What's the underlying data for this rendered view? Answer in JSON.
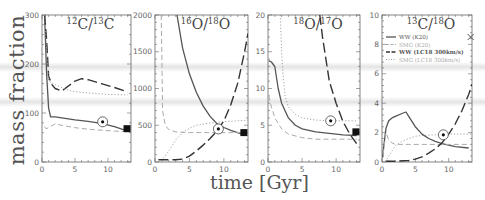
{
  "figure": {
    "ylabel": "mass fraction",
    "xlabel": "time [Gyr]"
  },
  "legend": {
    "entries": [
      {
        "label": "WW (K20)",
        "style": "solid",
        "color": "#555555"
      },
      {
        "label": "SMG (K20)",
        "style": "dashed",
        "color": "#aaaaaa"
      },
      {
        "label": "WW (LC18 300km/s)",
        "style": "long-dash",
        "color": "#333333"
      },
      {
        "label": "SMG (LC18 300km/s)",
        "style": "dotted",
        "color": "#999999"
      }
    ]
  },
  "chart_data": [
    {
      "type": "line",
      "title": "12C/13C",
      "title_parts": {
        "sup1": "12",
        "el1": "C",
        "sup2": "13",
        "el2": "C"
      },
      "xlabel": "time [Gyr]",
      "ylabel": "mass fraction",
      "xlim": [
        0,
        13.5
      ],
      "ylim": [
        0,
        300
      ],
      "xticks": [
        0,
        5,
        10
      ],
      "yticks": [
        0,
        100,
        200,
        300
      ],
      "series": [
        {
          "name": "WW (K20)",
          "x": [
            0.4,
            0.7,
            1.0,
            1.3,
            2,
            3,
            5,
            7,
            9,
            11,
            13
          ],
          "values": [
            300,
            180,
            110,
            92,
            92,
            90,
            86,
            83,
            79,
            72,
            63
          ]
        },
        {
          "name": "SMG (K20)",
          "x": [
            0.4,
            0.6,
            1,
            2,
            3,
            5,
            7,
            9,
            11,
            13
          ],
          "values": [
            72,
            68,
            70,
            78,
            75,
            70,
            67,
            65,
            63,
            62
          ]
        },
        {
          "name": "WW (LC18 300km/s)",
          "x": [
            0.4,
            0.7,
            1.0,
            1.5,
            2,
            3,
            4,
            5,
            6,
            7,
            9,
            11,
            13
          ],
          "values": [
            300,
            250,
            175,
            158,
            150,
            145,
            155,
            165,
            170,
            168,
            160,
            152,
            143
          ]
        },
        {
          "name": "SMG (LC18 300km/s)",
          "x": [
            0.4,
            0.7,
            1,
            2,
            4,
            6,
            8,
            10,
            13
          ],
          "values": [
            300,
            230,
            165,
            158,
            146,
            142,
            140,
            138,
            137
          ]
        }
      ],
      "markers": [
        {
          "type": "sun-circle",
          "x": 9.2,
          "y": 82
        },
        {
          "type": "filled-square",
          "x": 12.9,
          "y": 68
        }
      ]
    },
    {
      "type": "line",
      "title": "16O/18O",
      "title_parts": {
        "sup1": "16",
        "el1": "O",
        "sup2": "18",
        "el2": "O"
      },
      "xlabel": "time [Gyr]",
      "ylabel": "mass fraction",
      "xlim": [
        0,
        13.5
      ],
      "ylim": [
        0,
        2000
      ],
      "xticks": [
        0,
        5,
        10
      ],
      "yticks": [
        0,
        500,
        1000,
        1500,
        2000
      ],
      "series": [
        {
          "name": "WW (K20)",
          "x": [
            3.2,
            4,
            5,
            6,
            7,
            8,
            9,
            10,
            11,
            12,
            13
          ],
          "values": [
            2000,
            1550,
            1200,
            950,
            760,
            620,
            520,
            470,
            430,
            400,
            370
          ]
        },
        {
          "name": "SMG (K20)",
          "x": [
            0.9,
            1.0,
            1.1,
            1.5,
            2,
            3,
            5,
            7,
            9,
            11,
            13
          ],
          "values": [
            2000,
            1400,
            700,
            500,
            440,
            410,
            400,
            400,
            400,
            400,
            400
          ]
        },
        {
          "name": "WW (LC18 300km/s)",
          "x": [
            0.5,
            1,
            2,
            3,
            4,
            5,
            6,
            7,
            8,
            9,
            10,
            11,
            12,
            13,
            13.5
          ],
          "values": [
            30,
            30,
            30,
            30,
            40,
            80,
            150,
            230,
            320,
            420,
            560,
            780,
            1070,
            1500,
            1750
          ]
        },
        {
          "name": "SMG (LC18 300km/s)",
          "x": [
            0.5,
            1,
            2,
            3,
            4,
            5,
            6,
            8,
            10,
            12,
            13.5
          ],
          "values": [
            0,
            20,
            150,
            300,
            400,
            460,
            500,
            530,
            550,
            560,
            570
          ]
        }
      ],
      "markers": [
        {
          "type": "sun-circle",
          "x": 9.2,
          "y": 450
        },
        {
          "type": "filled-square",
          "x": 12.9,
          "y": 400
        }
      ]
    },
    {
      "type": "line",
      "title": "18O/17O",
      "title_parts": {
        "sup1": "18",
        "el1": "O",
        "sup2": "17",
        "el2": "O"
      },
      "xlabel": "time [Gyr]",
      "ylabel": "mass fraction",
      "xlim": [
        0,
        13.5
      ],
      "ylim": [
        0,
        20
      ],
      "xticks": [
        0,
        5,
        10
      ],
      "yticks": [
        0,
        5,
        10,
        15,
        20
      ],
      "series": [
        {
          "name": "WW (K20)",
          "x": [
            0.1,
            0.5,
            1,
            1.5,
            2,
            3,
            4,
            5,
            7,
            9,
            11,
            13
          ],
          "values": [
            13.8,
            13.6,
            13,
            10,
            8,
            6,
            5,
            4.5,
            4.1,
            3.9,
            3.7,
            3.6
          ]
        },
        {
          "name": "SMG (K20)",
          "x": [
            0.1,
            0.5,
            1,
            2,
            3,
            5,
            7,
            9,
            11,
            13
          ],
          "values": [
            9,
            7.5,
            6,
            4.5,
            3.8,
            3.3,
            3.1,
            3.1,
            3.1,
            3.1
          ]
        },
        {
          "name": "WW (LC18 300km/s)",
          "x": [
            7.6,
            8,
            9,
            10,
            11,
            12,
            13
          ],
          "values": [
            20,
            17,
            11,
            8,
            5.5,
            3.8,
            2.5
          ]
        },
        {
          "name": "SMG (LC18 300km/s)",
          "x": [
            1.8,
            2,
            2.2,
            2.5,
            3,
            4,
            5,
            7,
            9,
            11,
            13
          ],
          "values": [
            20,
            15,
            12,
            9,
            7.5,
            6.5,
            6,
            5.7,
            5.6,
            5.6,
            5.6
          ]
        }
      ],
      "markers": [
        {
          "type": "sun-circle",
          "x": 9.2,
          "y": 5.6
        },
        {
          "type": "filled-square",
          "x": 12.9,
          "y": 4.1
        }
      ]
    },
    {
      "type": "line",
      "title": "13C/18O",
      "title_parts": {
        "sup1": "13",
        "el1": "C",
        "sup2": "18",
        "el2": "O"
      },
      "xlabel": "time [Gyr]",
      "ylabel": "mass fraction",
      "xlim": [
        0,
        13.5
      ],
      "ylim": [
        0,
        10
      ],
      "xticks": [
        0,
        5,
        10
      ],
      "yticks": [
        0,
        2,
        4,
        6,
        8,
        10
      ],
      "legend_position": "upper right",
      "series": [
        {
          "name": "WW (K20)",
          "x": [
            0,
            0.3,
            0.6,
            1,
            1.5,
            2,
            3,
            3.6,
            4,
            5,
            6,
            7,
            8,
            9,
            10,
            11,
            13
          ],
          "values": [
            0,
            1.2,
            2.3,
            2.8,
            3.0,
            3.1,
            3.3,
            3.4,
            3.1,
            2.4,
            1.9,
            1.6,
            1.4,
            1.25,
            1.15,
            1.05,
            0.95
          ]
        },
        {
          "name": "SMG (K20)",
          "x": [
            0,
            0.3,
            0.6,
            1,
            1.5,
            2,
            4,
            6,
            8,
            10,
            13
          ],
          "values": [
            0,
            1.0,
            2.0,
            1.5,
            1.3,
            1.2,
            1.2,
            1.2,
            1.2,
            1.2,
            1.2
          ]
        },
        {
          "name": "WW (LC18 300km/s)",
          "x": [
            0.5,
            2,
            4,
            5,
            6,
            7,
            8,
            9,
            10,
            11,
            12,
            13,
            13.5
          ],
          "values": [
            0.05,
            0.05,
            0.1,
            0.2,
            0.35,
            0.6,
            0.9,
            1.3,
            1.9,
            2.6,
            3.5,
            4.6,
            5.3
          ]
        },
        {
          "name": "SMG (LC18 300km/s)",
          "x": [
            0.5,
            1,
            2,
            3,
            4,
            5,
            6,
            8,
            10,
            13.5
          ],
          "values": [
            0,
            0.4,
            1.1,
            1.4,
            1.6,
            1.75,
            1.8,
            1.85,
            1.9,
            1.9
          ]
        }
      ],
      "markers": [
        {
          "type": "sun-circle",
          "x": 9.2,
          "y": 1.85
        },
        {
          "type": "cross",
          "x": 13.3,
          "y": 8.5
        }
      ]
    }
  ]
}
